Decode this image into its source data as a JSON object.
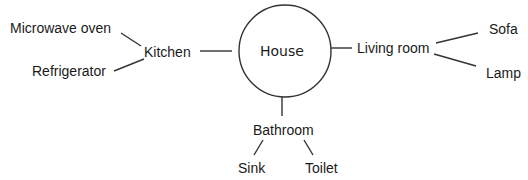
{
  "diagram": {
    "center": "House",
    "branches": {
      "kitchen": {
        "label": "Kitchen",
        "children": [
          "Microwave oven",
          "Refrigerator"
        ]
      },
      "living_room": {
        "label": "Living room",
        "children": [
          "Sofa",
          "Lamp"
        ]
      },
      "bathroom": {
        "label": "Bathroom",
        "children": [
          "Sink",
          "Toilet"
        ]
      }
    },
    "colors": {
      "stroke": "#333333",
      "text": "#1a1a1a"
    }
  }
}
